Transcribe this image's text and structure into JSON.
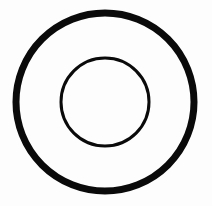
{
  "figure": {
    "type": "concentric-circles",
    "background": "#fdfdfd",
    "stroke_color": "#0a0a0a",
    "center": {
      "x": 105,
      "y": 102
    },
    "outer_circle": {
      "radius": 89,
      "stroke_width": 7
    },
    "inner_circle": {
      "radius": 44,
      "stroke_width": 3
    }
  }
}
